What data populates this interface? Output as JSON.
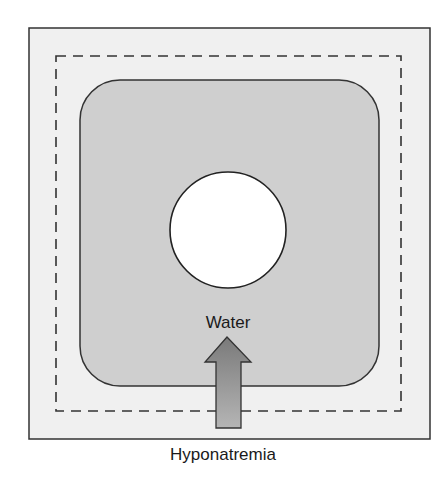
{
  "diagram": {
    "type": "cell-osmosis",
    "labels": {
      "arrow_label": "Water",
      "caption": "Hyponatremia"
    },
    "elements": {
      "extracellular_box": {
        "fill": "#f0f0f0",
        "stroke": "#333333"
      },
      "normal_cell_outline": {
        "style": "dashed",
        "stroke": "#333333"
      },
      "swollen_cell": {
        "fill": "#cfcfcf",
        "stroke": "#333333",
        "shape": "rounded-square"
      },
      "nucleus": {
        "fill": "#ffffff",
        "stroke": "#222222",
        "shape": "circle"
      },
      "arrow": {
        "direction": "up",
        "meaning": "water moves into cell",
        "fill": "#8c8c8c"
      }
    }
  }
}
